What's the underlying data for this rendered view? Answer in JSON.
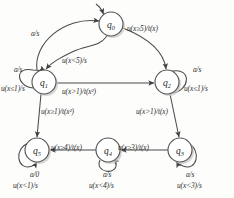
{
  "diagram": {
    "canvas": {
      "width": 234,
      "height": 198,
      "background": "#fdfdfc"
    },
    "stroke_color": "#4a4a4a",
    "node_fill": "#ffffff",
    "text_color": "#2b2b2b",
    "states": [
      {
        "id": "q0",
        "name": "q",
        "sub": "0",
        "cx": 111,
        "cy": 24,
        "r": 12,
        "initial": true
      },
      {
        "id": "q1",
        "name": "q",
        "sub": "1",
        "cx": 44,
        "cy": 82,
        "r": 12,
        "initial": false
      },
      {
        "id": "q2",
        "name": "q",
        "sub": "2",
        "cx": 167,
        "cy": 82,
        "r": 12,
        "initial": false
      },
      {
        "id": "q3",
        "name": "q",
        "sub": "3",
        "cx": 180,
        "cy": 150,
        "r": 12,
        "initial": false
      },
      {
        "id": "q4",
        "name": "q",
        "sub": "4",
        "cx": 108,
        "cy": 150,
        "r": 12,
        "initial": false
      },
      {
        "id": "q5",
        "name": "q",
        "sub": "5",
        "cx": 37,
        "cy": 150,
        "r": 12,
        "initial": false
      }
    ],
    "edge_labels": {
      "q1_to_q0": "a/s",
      "q0_to_q1": "u(x<5)/s",
      "q0_to_q2": "u(x≥5)/t(x)",
      "q1_to_q2": "u(x>1)/t(x²)",
      "q1_to_q5": "u(x≥1)/t(x²)",
      "q2_to_q3": "u(x>1)/t(x)",
      "q3_to_q4": "u(x≥3)/t(x)",
      "q4_to_q5": "u(x≥4)/t(x)"
    },
    "self_loops": {
      "q1": [
        "a/s",
        "u(x≤1)/s"
      ],
      "q2": [
        "a/s",
        "u(x≤1)/s"
      ],
      "q3": [
        "a/s",
        "u(x<3)/s"
      ],
      "q4": [
        "a/s",
        "u(x<4)/s"
      ],
      "q5": [
        "a/0",
        "u(x<1)/s"
      ]
    }
  }
}
